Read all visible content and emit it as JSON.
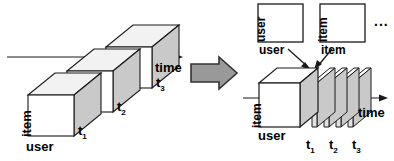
{
  "figure": {
    "type": "diagram",
    "background": "#ffffff",
    "stroke": "#1a1a1a",
    "face_front": "#ffffff",
    "face_side": "#c9c9c9",
    "face_top": "#f2f2f2",
    "arrow_fill": "#999999",
    "arrow_stroke": "#333333"
  },
  "left_panel": {
    "name": "sequence-of-cubes",
    "axis": {
      "label": "time"
    },
    "axes_labels": {
      "item": "item",
      "user": "user"
    },
    "cubes": [
      {
        "label": "t",
        "sub": "1"
      },
      {
        "label": "t",
        "sub": "2"
      },
      {
        "label": "t",
        "sub": "3"
      }
    ],
    "cube_labels": [
      "t1",
      "t2",
      "t3"
    ]
  },
  "transform_arrow": {
    "name": "block-arrow",
    "direction": "right"
  },
  "right_panel": {
    "name": "sliced-tensor",
    "axis": {
      "label": "time"
    },
    "axes_labels": {
      "item": "item",
      "user": "user"
    },
    "slices": [
      {
        "label": "t",
        "sub": "1"
      },
      {
        "label": "t",
        "sub": "2"
      },
      {
        "label": "t",
        "sub": "3"
      }
    ],
    "slice_labels": [
      "t1",
      "t2",
      "t3"
    ],
    "side_matrices": [
      {
        "row_label": "user",
        "col_label": "user"
      },
      {
        "row_label": "item",
        "col_label": "item"
      }
    ],
    "ellipsis": "..."
  }
}
